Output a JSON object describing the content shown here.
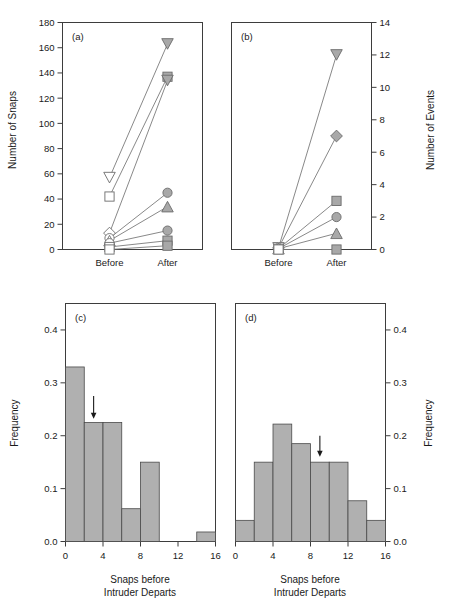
{
  "figure": {
    "panels": [
      "a",
      "b",
      "c",
      "d"
    ],
    "marker_fill_color": "#a8a8a8",
    "marker_stroke_color": "#6b6b6b",
    "bar_fill_color": "#b0b0b0",
    "bar_stroke_color": "#4a4a4a",
    "axis_color": "#3d3d3d"
  },
  "chart_data": [
    {
      "type": "line",
      "panel": "a",
      "title": "(a)",
      "xlabel": "",
      "ylabel": "Number of Snaps",
      "categories": [
        "Before",
        "After"
      ],
      "xtick_labels": [
        "Before",
        "After"
      ],
      "ytick_labels": [
        "0",
        "20",
        "40",
        "60",
        "80",
        "100",
        "120",
        "140",
        "160",
        "180"
      ],
      "yticks": [
        0,
        20,
        40,
        60,
        80,
        100,
        120,
        140,
        160,
        180
      ],
      "ylim": [
        0,
        180
      ],
      "y_axis_side": "left",
      "grid": false,
      "legend": "none",
      "series": [
        {
          "name": "series-1",
          "marker": "triangle-down-open-then-filled",
          "marker_before": "triangle-down-open",
          "marker_after": "triangle-down-filled",
          "values": [
            57,
            163
          ]
        },
        {
          "name": "series-2",
          "marker_before": "square-open",
          "marker_after": "square-filled",
          "values": [
            42,
            137
          ]
        },
        {
          "name": "series-3",
          "marker_before": "diamond-open",
          "marker_after": "triangle-down-filled",
          "values": [
            13,
            134
          ]
        },
        {
          "name": "series-4",
          "marker_before": "circle-open",
          "marker_after": "circle-filled",
          "values": [
            9,
            45
          ]
        },
        {
          "name": "series-5",
          "marker_before": "triangle-up-open",
          "marker_after": "triangle-up-filled",
          "values": [
            7,
            34
          ]
        },
        {
          "name": "series-6",
          "marker_before": "circle-open",
          "marker_after": "circle-filled",
          "values": [
            5,
            15
          ]
        },
        {
          "name": "series-7",
          "marker_before": "square-open",
          "marker_after": "square-filled",
          "values": [
            2,
            7
          ]
        },
        {
          "name": "series-8",
          "marker_before": "square-open",
          "marker_after": "square-filled",
          "values": [
            0,
            3
          ]
        }
      ]
    },
    {
      "type": "line",
      "panel": "b",
      "title": "(b)",
      "xlabel": "",
      "ylabel": "Number of Events",
      "categories": [
        "Before",
        "After"
      ],
      "xtick_labels": [
        "Before",
        "After"
      ],
      "ytick_labels": [
        "0",
        "2",
        "4",
        "6",
        "8",
        "10",
        "12",
        "14"
      ],
      "yticks": [
        0,
        2,
        4,
        6,
        8,
        10,
        12,
        14
      ],
      "ylim": [
        0,
        14
      ],
      "y_axis_side": "right",
      "grid": false,
      "legend": "none",
      "series": [
        {
          "name": "series-1",
          "marker_before": "triangle-down-open",
          "marker_after": "triangle-down-filled",
          "values": [
            0.1,
            12
          ]
        },
        {
          "name": "series-2",
          "marker_before": "diamond-open",
          "marker_after": "diamond-filled",
          "values": [
            0.1,
            7
          ]
        },
        {
          "name": "series-3",
          "marker_before": "square-open",
          "marker_after": "square-filled",
          "values": [
            0.05,
            3
          ]
        },
        {
          "name": "series-4",
          "marker_before": "circle-open",
          "marker_after": "circle-filled",
          "values": [
            0.05,
            2
          ]
        },
        {
          "name": "series-5",
          "marker_before": "triangle-up-open",
          "marker_after": "triangle-up-filled",
          "values": [
            0.05,
            1
          ]
        },
        {
          "name": "series-6",
          "marker_before": "square-open",
          "marker_after": "square-filled",
          "values": [
            0,
            0
          ]
        }
      ]
    },
    {
      "type": "bar",
      "panel": "c",
      "title": "(c)",
      "xlabel": "Snaps before Intruder Departs",
      "xlabel_line1": "Snaps before",
      "xlabel_line2": "Intruder Departs",
      "ylabel": "Frequency",
      "bin_edges": [
        0,
        2,
        4,
        6,
        8,
        10,
        12,
        14,
        16
      ],
      "categories": [
        "0-2",
        "2-4",
        "4-6",
        "6-8",
        "8-10",
        "10-12",
        "12-14",
        "14-16"
      ],
      "values": [
        0.33,
        0.225,
        0.225,
        0.062,
        0.15,
        0.0,
        0.0,
        0.018
      ],
      "xtick_labels": [
        "0",
        "4",
        "8",
        "12",
        "16"
      ],
      "xticks": [
        0,
        4,
        8,
        12,
        16
      ],
      "ytick_labels": [
        "0.0",
        "0.1",
        "0.2",
        "0.3",
        "0.4"
      ],
      "yticks": [
        0.0,
        0.1,
        0.2,
        0.3,
        0.4
      ],
      "xlim": [
        0,
        16
      ],
      "ylim": [
        0.0,
        0.45
      ],
      "y_axis_side": "left",
      "grid": false,
      "annotation": {
        "type": "arrow",
        "label": "mean-marker-arrow",
        "x": 3.0,
        "y_top": 0.275,
        "y_tip": 0.235
      }
    },
    {
      "type": "bar",
      "panel": "d",
      "title": "(d)",
      "xlabel": "Snaps before Intruder Departs",
      "xlabel_line1": "Snaps before",
      "xlabel_line2": "Intruder Departs",
      "ylabel": "Frequency",
      "bin_edges": [
        0,
        2,
        4,
        6,
        8,
        10,
        12,
        14,
        16
      ],
      "categories": [
        "0-2",
        "2-4",
        "4-6",
        "6-8",
        "8-10",
        "10-12",
        "12-14",
        "14-16"
      ],
      "values": [
        0.04,
        0.15,
        0.222,
        0.185,
        0.15,
        0.15,
        0.077,
        0.04
      ],
      "xtick_labels": [
        "0",
        "4",
        "8",
        "12",
        "16"
      ],
      "xticks": [
        0,
        4,
        8,
        12,
        16
      ],
      "ytick_labels": [
        "0.0",
        "0.1",
        "0.2",
        "0.3",
        "0.4"
      ],
      "yticks": [
        0.0,
        0.1,
        0.2,
        0.3,
        0.4
      ],
      "xlim": [
        0,
        16
      ],
      "ylim": [
        0.0,
        0.45
      ],
      "y_axis_side": "right",
      "grid": false,
      "annotation": {
        "type": "arrow",
        "label": "mean-marker-arrow",
        "x": 9.0,
        "y_top": 0.2,
        "y_tip": 0.163
      }
    }
  ]
}
